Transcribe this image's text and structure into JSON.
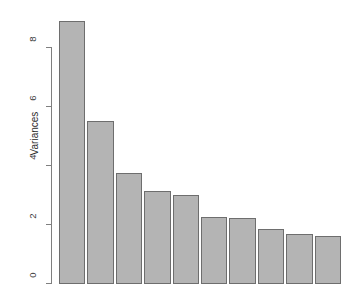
{
  "chart_data": {
    "type": "bar",
    "title": "",
    "subtitle": "",
    "xlabel": "",
    "ylabel": "Variances",
    "categories": [
      "1",
      "2",
      "3",
      "4",
      "5",
      "6",
      "7",
      "8",
      "9",
      "10"
    ],
    "values": [
      8.92,
      5.53,
      3.76,
      3.15,
      3.02,
      2.27,
      2.24,
      1.85,
      1.7,
      1.63
    ],
    "ylim": [
      0,
      9.2
    ],
    "y_ticks": [
      0,
      2,
      4,
      6,
      8
    ],
    "y_tick_labels": [
      "0",
      "2",
      "4",
      "6",
      "8"
    ],
    "x_tick_labels": [],
    "grid": false,
    "legend": null,
    "bar_fill_color": "#b4b4b4",
    "bar_border_color": "#6e6e6e",
    "axis_color": "#7f7f7f",
    "background_color": "#ffffff",
    "annotations": []
  },
  "plot": {
    "geometry": {
      "left_px": 59,
      "right_px": 343,
      "baseline_y_px": 284,
      "y_zero_px": 283,
      "px_per_unit": 29.5,
      "bar_pitch_px": 28.4,
      "bar_width_px": 26.4,
      "axis_x_px": 51
    }
  }
}
